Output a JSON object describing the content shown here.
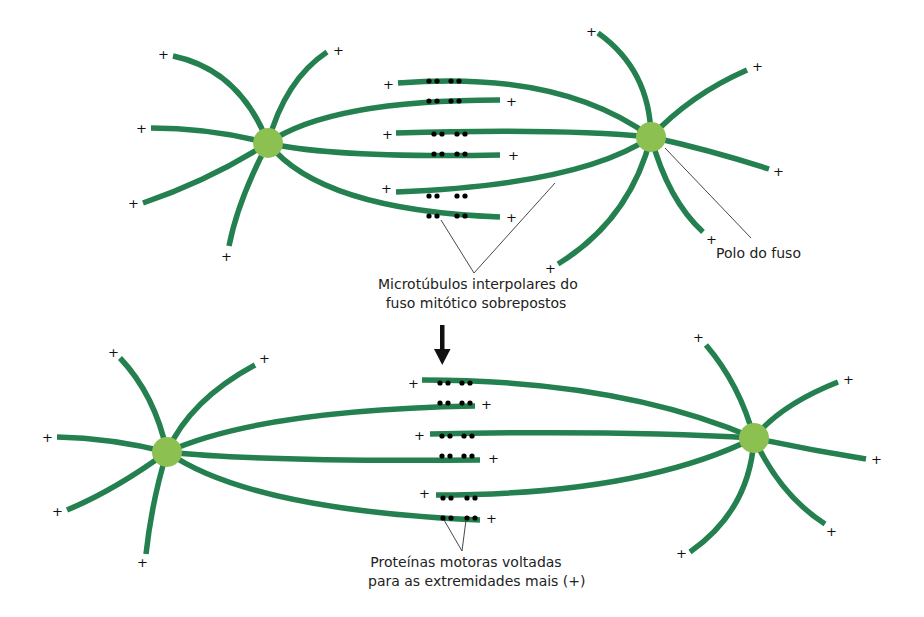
{
  "diagram": {
    "colors": {
      "microtubule": "#24804f",
      "pole": "#8cc152",
      "motor_protein": "#c8384f",
      "text": "#222222",
      "arrow": "#111111"
    },
    "plus_symbol": "+",
    "labels": {
      "spindle_pole": "Polo do fuso",
      "interpolar_line1": "Microtúbulos interpolares do",
      "interpolar_line2": "fuso mitótico sobrepostos",
      "motor_line1": "Proteínas motoras voltadas",
      "motor_line2": "para as extremidades mais (+)"
    },
    "panels": [
      {
        "name": "before",
        "left_pole": {
          "x": 268,
          "y": 143
        },
        "right_pole": {
          "x": 651,
          "y": 137
        },
        "overlap_pairs": 3,
        "motors_per_pair": 2
      },
      {
        "name": "after",
        "left_pole": {
          "x": 167,
          "y": 452
        },
        "right_pole": {
          "x": 754,
          "y": 438
        },
        "overlap_pairs": 3,
        "motors_per_pair": 2
      }
    ],
    "transition": "down-arrow"
  }
}
